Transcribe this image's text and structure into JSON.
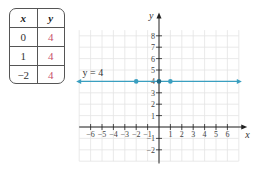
{
  "table": {
    "headers": [
      "x",
      "y"
    ],
    "rows": [
      {
        "x": "0",
        "y": "4"
      },
      {
        "x": "1",
        "y": "4"
      },
      {
        "x": "−2",
        "y": "4"
      }
    ]
  },
  "chart_data": {
    "type": "line",
    "title": "",
    "xlabel": "x",
    "ylabel": "y",
    "equation_label": "y = 4",
    "xlim": [
      -7,
      7
    ],
    "ylim": [
      -3,
      9
    ],
    "x_ticks": [
      "−6",
      "−5",
      "−4",
      "−3",
      "−2",
      "−1",
      "1",
      "2",
      "3",
      "4",
      "5",
      "6"
    ],
    "y_ticks": [
      "−2",
      "−1",
      "1",
      "2",
      "3",
      "4",
      "5",
      "6",
      "7",
      "8"
    ],
    "grid": true,
    "series": [
      {
        "name": "y = 4",
        "x": [
          -7,
          7
        ],
        "y": [
          4,
          4
        ],
        "color": "#3a9fc0",
        "arrows": "both"
      }
    ],
    "points": [
      {
        "x": 0,
        "y": 4
      },
      {
        "x": 1,
        "y": 4
      },
      {
        "x": -2,
        "y": 4
      }
    ],
    "colors": {
      "line": "#3a9fc0",
      "grid": "#e4e4e4",
      "axis": "#222222",
      "table_y": "#c8506a"
    }
  }
}
